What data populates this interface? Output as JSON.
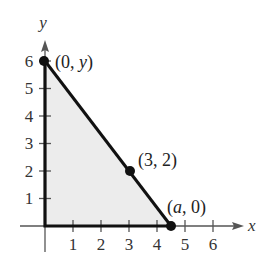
{
  "diagram": {
    "axes": {
      "x_label": "x",
      "y_label": "y",
      "x_ticks": [
        "1",
        "2",
        "3",
        "4",
        "5",
        "6"
      ],
      "y_ticks": [
        "1",
        "2",
        "3",
        "4",
        "5",
        "6"
      ]
    },
    "region": {
      "shape": "triangle",
      "vertices": [
        [
          0,
          0
        ],
        [
          0,
          6
        ],
        [
          4.5,
          0
        ]
      ],
      "fill_color": "#ececec",
      "edge_color": "#111111"
    },
    "points": [
      {
        "label_open": "(",
        "label_a": "0",
        "label_sep": ", ",
        "label_b": "y",
        "label_close": ")",
        "x": 0,
        "y": 6
      },
      {
        "label_open": "(",
        "label_a": "3",
        "label_sep": ", ",
        "label_b": "2",
        "label_close": ")",
        "x": 3,
        "y": 2
      },
      {
        "label_open": "(",
        "label_a": "a",
        "label_sep": ", ",
        "label_b": "0",
        "label_close": ")",
        "x": 4.5,
        "y": 0
      }
    ]
  }
}
